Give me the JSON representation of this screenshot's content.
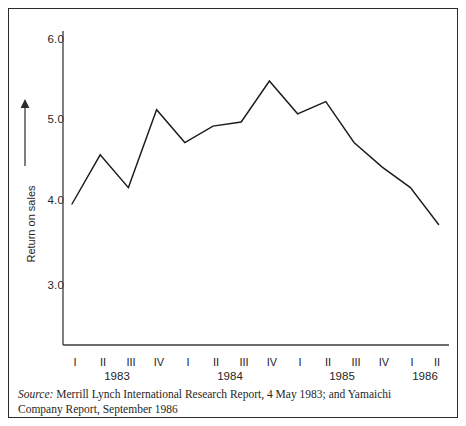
{
  "figure": {
    "background": "#ffffff",
    "border_color": "#2b2b2b",
    "line_color": "#1a1a1a",
    "axis_color": "#3a3a3a"
  },
  "yaxis": {
    "title": "Return on sales",
    "arrow": "up-arrow-icon",
    "ticks": [
      "6.0",
      "5.0",
      "4.0",
      "3.0"
    ]
  },
  "xaxis": {
    "quarter_labels": [
      "I",
      "II",
      "III",
      "IV",
      "I",
      "II",
      "III",
      "IV",
      "I",
      "II",
      "III",
      "IV",
      "I",
      "II"
    ],
    "years": [
      "1983",
      "1984",
      "1985",
      "1986"
    ]
  },
  "source": {
    "label": "Source:",
    "text": "Merrill Lynch International Research Report, 4 May 1983; and Yamaichi Company Report, September 1986"
  },
  "chart_data": {
    "type": "line",
    "title": "",
    "xlabel": "",
    "ylabel": "Return on sales",
    "ylim": [
      2.6,
      6.35
    ],
    "yticks": [
      6.0,
      5.0,
      4.0,
      3.0
    ],
    "grid": false,
    "legend": "none",
    "categories": [
      "1983 I",
      "1983 II",
      "1983 III",
      "1983 IV",
      "1984 I",
      "1984 II",
      "1984 III",
      "1984 IV",
      "1985 I",
      "1985 II",
      "1985 III",
      "1985 IV",
      "1986 I",
      "1986 II"
    ],
    "values": [
      4.0,
      4.6,
      4.2,
      5.15,
      4.75,
      4.95,
      5.0,
      5.5,
      5.1,
      5.25,
      4.75,
      4.45,
      4.2,
      3.75
    ],
    "series": [
      {
        "name": "Return on sales",
        "values": [
          4.0,
          4.6,
          4.2,
          5.15,
          4.75,
          4.95,
          5.0,
          5.5,
          5.1,
          5.25,
          4.75,
          4.45,
          4.2,
          3.75
        ]
      }
    ]
  }
}
